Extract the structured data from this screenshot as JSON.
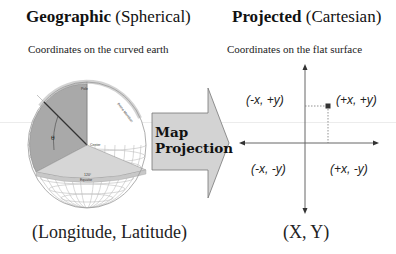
{
  "left_panel": {
    "title_bold": "Geographic",
    "title_rest": " (Spherical)",
    "subtitle": "Coordinates on the curved earth",
    "globe_labels": {
      "pole": "Pole",
      "prime_meridian": "Prime Meridian",
      "center": "Center",
      "angle": "120°",
      "equator": "Equator",
      "theta": "θ"
    },
    "bottom_label": "(Longitude, Latitude)"
  },
  "arrow": {
    "line1": "Map",
    "line2": "Projection",
    "fill_color": "#d3d3d3"
  },
  "right_panel": {
    "title_bold": "Projected",
    "title_rest": " (Cartesian)",
    "subtitle": "Coordinates on the flat surface",
    "quadrants": {
      "top_left": "(-x, +y)",
      "top_right": "(+x, +y)",
      "bottom_left": "(-x, -y)",
      "bottom_right": "(+x, -y)"
    },
    "bottom_label": "(X, Y)"
  }
}
